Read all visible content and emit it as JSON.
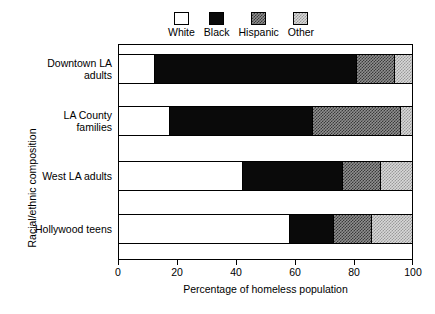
{
  "chart_data": {
    "type": "bar",
    "orientation": "horizontal",
    "stacked": true,
    "title": "",
    "xlabel": "Percentage of homeless population",
    "ylabel": "Racial/ethnic composition",
    "xlim": [
      0,
      100
    ],
    "xticks": [
      0,
      20,
      40,
      60,
      80,
      100
    ],
    "xticklabels": [
      "0",
      "20",
      "40",
      "60",
      "80",
      "100"
    ],
    "grid": false,
    "legend_position": "top",
    "categories": [
      "Downtown LA adults",
      "LA County families",
      "West LA adults",
      "Hollywood teens"
    ],
    "series": [
      {
        "name": "White",
        "values": [
          12,
          17,
          42,
          58
        ],
        "swatch": "fill-white",
        "color": "#ffffff"
      },
      {
        "name": "Black",
        "values": [
          69,
          49,
          34,
          15
        ],
        "swatch": "fill-black",
        "color": "#0a0a0a"
      },
      {
        "name": "Hispanic",
        "values": [
          13,
          30,
          13,
          13
        ],
        "swatch": "fill-hispanic",
        "color": "#8f8f8f"
      },
      {
        "name": "Other",
        "values": [
          6,
          4,
          11,
          14
        ],
        "swatch": "fill-other",
        "color": "#d8d8d8"
      }
    ],
    "cumulative_boundaries": [
      [
        0,
        12,
        81,
        94,
        100
      ],
      [
        0,
        17,
        66,
        96,
        100
      ],
      [
        0,
        42,
        76,
        89,
        100
      ],
      [
        0,
        58,
        73,
        86,
        100
      ]
    ]
  },
  "legend": {
    "items": [
      {
        "label": "White"
      },
      {
        "label": "Black"
      },
      {
        "label": "Hispanic"
      },
      {
        "label": "Other"
      }
    ]
  },
  "axes": {
    "x": {
      "title": "Percentage of homeless population",
      "ticks": [
        {
          "label": "0",
          "value": 0
        },
        {
          "label": "20",
          "value": 20
        },
        {
          "label": "40",
          "value": 40
        },
        {
          "label": "60",
          "value": 60
        },
        {
          "label": "80",
          "value": 80
        },
        {
          "label": "100",
          "value": 100
        }
      ]
    },
    "y": {
      "title": "Racial/ethnic composition",
      "ticks": [
        {
          "line1": "Downtown LA",
          "line2": "adults"
        },
        {
          "line1": "LA County",
          "line2": "families"
        },
        {
          "line1": "West LA adults",
          "line2": ""
        },
        {
          "line1": "Hollywood teens",
          "line2": ""
        }
      ]
    }
  }
}
